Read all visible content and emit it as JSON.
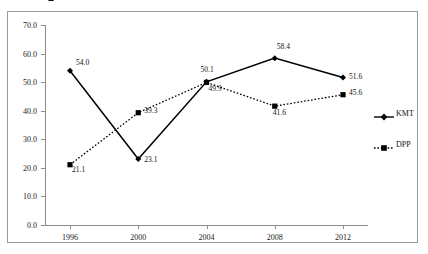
{
  "top_partial_glyph": "2",
  "chart_data": {
    "type": "line",
    "title": "",
    "subtitle": "",
    "xlabel": "",
    "ylabel": "",
    "x": [
      "1996",
      "2000",
      "2004",
      "2008",
      "2012"
    ],
    "categories": [
      "1996",
      "2000",
      "2004",
      "2008",
      "2012"
    ],
    "ylim": [
      0.0,
      70.0
    ],
    "ytick_labels": [
      "0.0",
      "10.0",
      "20.0",
      "30.0",
      "40.0",
      "50.0",
      "60.0",
      "70.0"
    ],
    "ytick_values": [
      0.0,
      10.0,
      20.0,
      30.0,
      40.0,
      50.0,
      60.0,
      70.0
    ],
    "grid": false,
    "legend_position": "right",
    "series": [
      {
        "name": "KMT",
        "values": [
          54.0,
          23.1,
          50.1,
          58.4,
          51.6
        ],
        "labels": [
          "54.0",
          "23.1",
          "50.1",
          "58.4",
          "51.6"
        ],
        "line_style": "solid",
        "marker": "diamond",
        "color": "#000000"
      },
      {
        "name": "DPP",
        "values": [
          21.1,
          39.3,
          49.9,
          41.6,
          45.6
        ],
        "labels": [
          "21.1",
          "39.3",
          "49.9",
          "41.6",
          "45.6"
        ],
        "line_style": "dotted",
        "marker": "square",
        "color": "#000000"
      }
    ]
  },
  "legend": {
    "items": [
      {
        "label": "KMT"
      },
      {
        "label": "DPP"
      }
    ]
  },
  "colors": {
    "frame": "#9a9a9a",
    "axis": "#8d8d8d",
    "series": "#000000",
    "background": "#ffffff"
  }
}
